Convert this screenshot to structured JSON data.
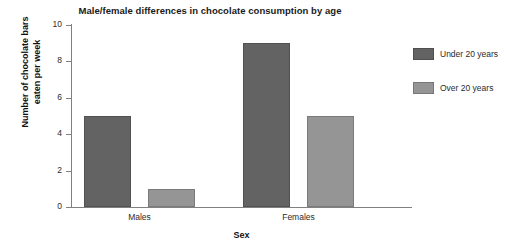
{
  "chart_data": {
    "type": "bar",
    "title": "Male/female differences in chocolate consumption by age",
    "xlabel": "Sex",
    "ylabel": "Number of chocolate bars eaten per week",
    "ylabel_line1": "Number of chocolate bars",
    "ylabel_line2": "eaten per week",
    "categories": [
      "Males",
      "Females"
    ],
    "series": [
      {
        "name": "Under 20 years",
        "values": [
          5,
          9
        ],
        "color": "#636363"
      },
      {
        "name": "Over 20 years",
        "values": [
          1,
          5
        ],
        "color": "#959595"
      }
    ],
    "ylim": [
      0,
      10
    ],
    "yticks": [
      0,
      2,
      4,
      6,
      8,
      10
    ],
    "ytick_labels": [
      "0",
      "2",
      "4",
      "6",
      "8",
      "10"
    ],
    "grid": false,
    "legend_position": "right"
  },
  "colors": {
    "series_under20": "#636363",
    "series_over20": "#959595",
    "axis": "#808080",
    "text": "#2b2b2b",
    "background": "#ffffff"
  }
}
